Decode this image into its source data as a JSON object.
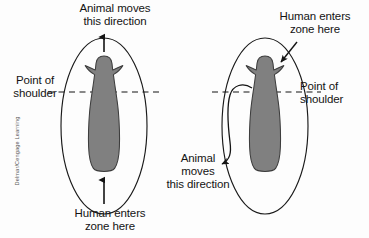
{
  "figure": {
    "type": "instructional-diagram",
    "background_color": "#fdfdfd",
    "line_color": "#1a1a1a",
    "animal_fill_color": "#808080",
    "animal_outline_color": "#3d3d3d",
    "credit": "Delmar/Cengage Learning"
  },
  "panels": {
    "left": {
      "name": "animal-moves-forward-panel",
      "labels": {
        "top": "Animal moves\nthis direction",
        "shoulder": "Point of\nshoulder",
        "bottom": "Human enters\nzone here"
      },
      "annotations": {
        "top_arrow": "arrow pointing up from flight zone edge to animal",
        "bottom_arrow": "arrow pointing up into flight zone from behind",
        "shoulder_line": "horizontal dashed line at point of shoulder"
      }
    },
    "right": {
      "name": "animal-turns-back-panel",
      "labels": {
        "top": "Human enters\nzone here",
        "shoulder": "Point of\nshoulder",
        "animal": "Animal\nmoves\nthis direction"
      },
      "annotations": {
        "entry_arrow": "arrow pointing into flight zone ahead of shoulder",
        "curved_path_arrow": "curved arrow showing animal turning back past the handler",
        "shoulder_line": "horizontal dashed line at point of shoulder"
      }
    }
  }
}
